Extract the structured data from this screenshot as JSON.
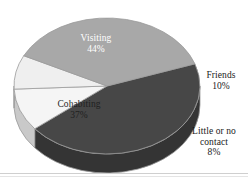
{
  "figure": {
    "background": "#ffffff",
    "width": 248,
    "height": 182,
    "has_bottom_rule": true
  },
  "chart_data": {
    "type": "pie",
    "title": "",
    "subtitle": "",
    "xlabel": "",
    "ylabel": "",
    "grid": false,
    "legend_position": "none",
    "style": "3d-pie-exploded-none",
    "label_format": "name + percent",
    "total_percent": 100,
    "categories": [
      "Visiting",
      "Friends",
      "Little or no contact",
      "Cohabiting"
    ],
    "values": [
      44,
      10,
      8,
      37
    ],
    "slices": [
      {
        "label": "Visiting",
        "percent": 44,
        "percent_text": "44%",
        "color": "#474747",
        "side_color": "#343434",
        "label_placement": "inside",
        "label_color": "#ffffff",
        "start_angle_deg": -19,
        "sweep_deg": 158.4
      },
      {
        "label": "Friends",
        "percent": 10,
        "percent_text": "10%",
        "color": "#f5f5f5",
        "side_color": "#c9c9c9",
        "label_placement": "outside-right",
        "label_color": "#1a1a1a",
        "start_angle_deg": -19,
        "sweep_deg": 36
      },
      {
        "label": "Little or no contact",
        "label_line_1": "Little or no",
        "label_line_2": "contact",
        "percent": 8,
        "percent_text": "8%",
        "color": "#efefef",
        "side_color": "#c0c0c0",
        "label_placement": "outside-right",
        "label_color": "#1a1a1a",
        "start_angle_deg": 17,
        "sweep_deg": 28.8
      },
      {
        "label": "Cohabiting",
        "percent": 37,
        "percent_text": "37%",
        "color": "#a8a8a8",
        "side_color": "#7d7d7d",
        "label_placement": "inside",
        "label_color": "#1f1f1f",
        "start_angle_deg": 45.8,
        "sweep_deg": 133.2
      }
    ],
    "geometry": {
      "center_x": 107,
      "center_y": 86,
      "radius_x": 93,
      "radius_y": 68,
      "depth": 19,
      "outline_color": "#9a9a9a"
    }
  }
}
